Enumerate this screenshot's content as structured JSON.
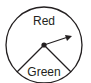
{
  "spinner": {
    "sections": [
      {
        "label": "Red",
        "description": "large upper section"
      },
      {
        "label": "Green",
        "description": "lower wedge section"
      }
    ],
    "pointer": "arrow from center pointing upper-right",
    "stroke_color": "#231f20",
    "background": "#ffffff"
  }
}
